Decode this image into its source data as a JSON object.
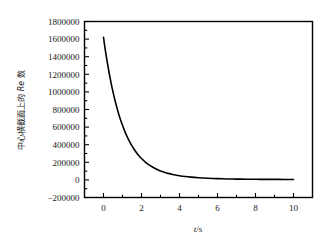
{
  "chart_data": {
    "type": "line",
    "title": "",
    "xlabel": "t/s",
    "ylabel": "中心横截面上的 Re 数",
    "ylabel_parts": {
      "cjk_prefix": "中心横截面上的",
      "symbol": "Re",
      "cjk_suffix": "数"
    },
    "xlabel_parts": {
      "symbol": "t",
      "separator": "/",
      "unit": "s"
    },
    "xlim": [
      -1,
      11
    ],
    "ylim": [
      -200000,
      1800000
    ],
    "xticks": [
      0,
      2,
      4,
      6,
      8,
      10
    ],
    "xtick_labels": [
      "0",
      "2",
      "4",
      "6",
      "8",
      "10"
    ],
    "yticks": [
      -200000,
      0,
      200000,
      400000,
      600000,
      800000,
      1000000,
      1200000,
      1400000,
      1600000,
      1800000
    ],
    "ytick_labels": [
      "−200000",
      "0",
      "200000",
      "400000",
      "600000",
      "800000",
      "1000000",
      "1200000",
      "1400000",
      "1600000",
      "1800000"
    ],
    "minor_ticks_per_interval": 1,
    "grid": false,
    "legend": null,
    "line_color": "#000000",
    "frame_color": "#000000",
    "background_color": "#ffffff",
    "series": [
      {
        "name": "Re at central cross-section",
        "x": [
          0.0,
          0.1,
          0.2,
          0.3,
          0.4,
          0.5,
          0.6,
          0.7,
          0.8,
          0.9,
          1.0,
          1.1,
          1.2,
          1.3,
          1.4,
          1.5,
          1.6,
          1.7,
          1.8,
          1.9,
          2.0,
          2.2,
          2.4,
          2.6,
          2.8,
          3.0,
          3.2,
          3.4,
          3.6,
          3.8,
          4.0,
          4.3,
          4.6,
          5.0,
          5.5,
          6.0,
          6.5,
          7.0,
          7.5,
          8.0,
          8.5,
          9.0,
          9.5,
          10.0
        ],
        "y": [
          1620000,
          1470000,
          1335000,
          1212000,
          1100000,
          1000000,
          908000,
          825000,
          750000,
          681000,
          620000,
          563000,
          512000,
          466000,
          424000,
          386000,
          351000,
          320000,
          292000,
          266000,
          243000,
          203000,
          170000,
          143000,
          121000,
          102000,
          87000,
          74000,
          64000,
          55000,
          47000,
          38000,
          31000,
          24000,
          18000,
          14000,
          11000,
          9000,
          8000,
          7000,
          6000,
          6000,
          5000,
          5000
        ],
        "model": "exponential decay: y = 1620000 * exp(-t/1.03)"
      }
    ],
    "annotations": []
  }
}
